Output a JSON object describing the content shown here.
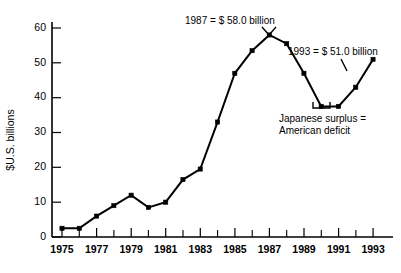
{
  "chart_data": {
    "type": "line",
    "title": "",
    "subtitle": "",
    "xlabel": "",
    "ylabel": "$U.S. billions",
    "xlim": [
      1975,
      1993
    ],
    "ylim": [
      0,
      63
    ],
    "yticks": [
      0,
      10,
      20,
      30,
      40,
      50,
      60
    ],
    "ytick_labels": [
      "0",
      "10",
      "20",
      "30",
      "40",
      "50",
      "60"
    ],
    "xticks": [
      1975,
      1976,
      1977,
      1978,
      1979,
      1980,
      1981,
      1982,
      1983,
      1984,
      1985,
      1986,
      1987,
      1988,
      1989,
      1990,
      1991,
      1992,
      1993
    ],
    "xtick_labels_shown": [
      "1975",
      "1977",
      "1979",
      "1981",
      "1983",
      "1985",
      "1987",
      "1989",
      "1991",
      "1993"
    ],
    "grid": false,
    "legend": "none",
    "markers": "filled-square",
    "x": [
      1975,
      1976,
      1977,
      1978,
      1979,
      1980,
      1981,
      1982,
      1983,
      1984,
      1985,
      1986,
      1987,
      1988,
      1989,
      1990,
      1991,
      1992,
      1993
    ],
    "values": [
      2.5,
      2.5,
      6.0,
      9.0,
      12.0,
      8.5,
      10.0,
      16.5,
      19.5,
      33.0,
      47.0,
      53.5,
      58.0,
      55.5,
      47.0,
      37.5,
      37.5,
      43.0,
      51.0
    ],
    "series": [
      {
        "name": "Japanese surplus = American deficit",
        "values": [
          2.5,
          2.5,
          6.0,
          9.0,
          12.0,
          8.5,
          10.0,
          16.5,
          19.5,
          33.0,
          47.0,
          53.5,
          58.0,
          55.5,
          47.0,
          37.5,
          37.5,
          43.0,
          51.0
        ]
      }
    ],
    "annotations": [
      {
        "id": "peak-1987",
        "text": "1987 = $ 58.0 billion",
        "target_x": 1987,
        "target_y": 58.0
      },
      {
        "id": "end-1993",
        "text": "1993 = $ 51.0 billion",
        "target_x": 1993,
        "target_y": 51.0
      },
      {
        "id": "trough-note-line1",
        "text": "Japanese surplus =",
        "target_x": 1990.5,
        "target_y": 37.5
      },
      {
        "id": "trough-note-line2",
        "text": "American deficit",
        "target_x": 1990.5,
        "target_y": 37.5
      }
    ],
    "colors": {
      "line": "#000000",
      "marker": "#000000",
      "axis": "#000000",
      "background": "#ffffff",
      "text": "#000000"
    }
  },
  "axes": {
    "y_label": "$U.S. billions",
    "y_tick_0": "0",
    "y_tick_10": "10",
    "y_tick_20": "20",
    "y_tick_30": "30",
    "y_tick_40": "40",
    "y_tick_50": "50",
    "y_tick_60": "60",
    "x_tick_1975": "1975",
    "x_tick_1977": "1977",
    "x_tick_1979": "1979",
    "x_tick_1981": "1981",
    "x_tick_1983": "1983",
    "x_tick_1985": "1985",
    "x_tick_1987": "1987",
    "x_tick_1989": "1989",
    "x_tick_1991": "1991",
    "x_tick_1993": "1993"
  },
  "annotations": {
    "peak_1987": "1987 = $ 58.0 billion",
    "end_1993": "1993 = $ 51.0 billion",
    "note_line_1": "Japanese surplus =",
    "note_line_2": "American deficit"
  }
}
